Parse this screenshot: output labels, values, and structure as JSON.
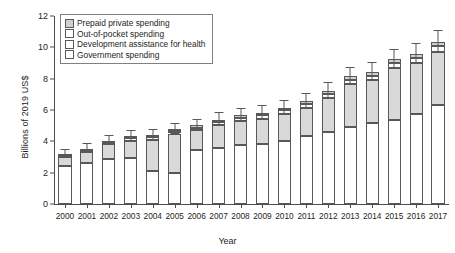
{
  "chart_data": {
    "type": "bar",
    "stacked": true,
    "title": "",
    "xlabel": "Year",
    "ylabel": "Billions of 2019 US$",
    "categories": [
      "2000",
      "2001",
      "2002",
      "2003",
      "2004",
      "2005",
      "2006",
      "2007",
      "2008",
      "2009",
      "2010",
      "2011",
      "2012",
      "2013",
      "2014",
      "2015",
      "2016",
      "2017"
    ],
    "ylim": [
      0,
      12
    ],
    "yticks": [
      0,
      2,
      4,
      6,
      8,
      10,
      12
    ],
    "ytick_labels": [
      "0",
      "2",
      "4",
      "6",
      "8",
      "10",
      "12"
    ],
    "grid": false,
    "legend_position": "top-left",
    "series": [
      {
        "name": "Government spending",
        "color": "#ffffff",
        "values": [
          2.45,
          2.6,
          2.85,
          2.95,
          2.1,
          1.95,
          3.45,
          3.55,
          3.75,
          3.85,
          4.05,
          4.35,
          4.6,
          4.9,
          5.15,
          5.35,
          5.75,
          6.35
        ]
      },
      {
        "name": "Development assistance for health",
        "color": "#d9d9d9",
        "values": [
          0.55,
          0.7,
          0.95,
          1.1,
          2.0,
          2.55,
          1.25,
          1.5,
          1.55,
          1.6,
          1.7,
          1.8,
          2.15,
          2.75,
          2.75,
          3.35,
          3.25,
          3.35
        ]
      },
      {
        "name": "Out-of-pocket spending",
        "color": "#ffffff",
        "values": [
          0.12,
          0.13,
          0.14,
          0.15,
          0.16,
          0.17,
          0.18,
          0.19,
          0.2,
          0.21,
          0.22,
          0.24,
          0.26,
          0.28,
          0.3,
          0.32,
          0.34,
          0.36
        ]
      },
      {
        "name": "Prepaid private spending",
        "color": "#d0d0d0",
        "values": [
          0.08,
          0.09,
          0.1,
          0.11,
          0.12,
          0.13,
          0.14,
          0.15,
          0.16,
          0.17,
          0.18,
          0.19,
          0.2,
          0.21,
          0.22,
          0.23,
          0.24,
          0.25
        ]
      }
    ],
    "totals": [
      3.2,
      3.52,
      4.04,
      4.31,
      4.38,
      4.8,
      5.02,
      5.39,
      5.66,
      5.83,
      6.15,
      6.58,
      7.21,
      8.14,
      8.42,
      9.25,
      9.58,
      10.31
    ],
    "error_bars": [
      {
        "low": 3.02,
        "high": 3.5
      },
      {
        "low": 3.3,
        "high": 3.88
      },
      {
        "low": 3.8,
        "high": 4.4
      },
      {
        "low": 4.05,
        "high": 4.7
      },
      {
        "low": 4.12,
        "high": 4.78
      },
      {
        "low": 4.52,
        "high": 5.18
      },
      {
        "low": 4.72,
        "high": 5.42
      },
      {
        "low": 5.06,
        "high": 5.86
      },
      {
        "low": 5.32,
        "high": 6.12
      },
      {
        "low": 5.48,
        "high": 6.3
      },
      {
        "low": 5.78,
        "high": 6.64
      },
      {
        "low": 6.2,
        "high": 7.1
      },
      {
        "low": 6.78,
        "high": 7.78
      },
      {
        "low": 7.66,
        "high": 8.76
      },
      {
        "low": 7.92,
        "high": 9.04
      },
      {
        "low": 8.7,
        "high": 9.92
      },
      {
        "low": 9.0,
        "high": 10.28
      },
      {
        "low": 9.68,
        "high": 11.08
      }
    ]
  },
  "legend": {
    "items": [
      {
        "label": "Prepaid private spending",
        "color": "#d0d0d0"
      },
      {
        "label": "Out-of-pocket spending",
        "color": "#ffffff"
      },
      {
        "label": "Development assistance for health",
        "color": "#ffffff"
      },
      {
        "label": "Government spending",
        "color": "#ffffff"
      }
    ]
  }
}
